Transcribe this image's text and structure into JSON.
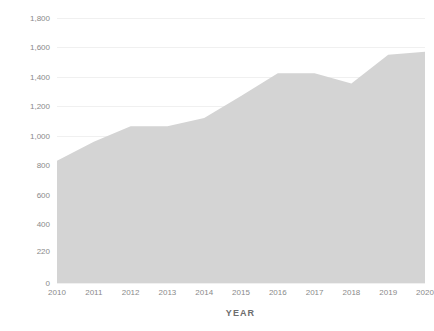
{
  "chart_data": {
    "type": "area",
    "title": "",
    "xlabel": "YEAR",
    "ylabel": "COMPLETIONS",
    "x": [
      2010,
      2011,
      2012,
      2013,
      2014,
      2015,
      2016,
      2017,
      2018,
      2019,
      2020
    ],
    "categories": [
      "2010",
      "2011",
      "2012",
      "2013",
      "2014",
      "2015",
      "2016",
      "2017",
      "2018",
      "2019",
      "2020"
    ],
    "values": [
      830,
      960,
      1065,
      1065,
      1120,
      1270,
      1425,
      1425,
      1355,
      1550,
      1570
    ],
    "series": [
      {
        "name": "Completions",
        "values": [
          830,
          960,
          1065,
          1065,
          1120,
          1270,
          1425,
          1425,
          1355,
          1550,
          1570
        ]
      }
    ],
    "ylim": [
      0,
      1800
    ],
    "xlim": [
      2010,
      2020
    ],
    "ytick_labels": [
      "1,800",
      "1,600",
      "1,400",
      "1,200",
      "1,000",
      "800",
      "600",
      "400",
      "220",
      "0"
    ],
    "ytick_values": [
      1800,
      1600,
      1400,
      1200,
      1000,
      800,
      600,
      400,
      220,
      0
    ],
    "xtick_labels": [
      "2010",
      "2011",
      "2012",
      "2013",
      "2014",
      "2015",
      "2016",
      "2017",
      "2018",
      "2019",
      "2020"
    ],
    "grid": true,
    "legend": false,
    "legend_position": "none",
    "colors": {
      "area_fill": "#d4d4d4",
      "gridline": "#f0f0f0",
      "tick_label": "#8a8a8a",
      "axis_title": "#6d6d6d",
      "background": "#ffffff"
    }
  },
  "axis": {
    "y_title": "COMPLETIONS",
    "x_title": "YEAR"
  }
}
